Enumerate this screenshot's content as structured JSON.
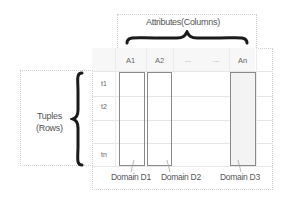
{
  "attributes": {
    "label": "Attributes(Columns)"
  },
  "tuples": {
    "label_line1": "Tuples",
    "label_line2": "(Rows)"
  },
  "table": {
    "headers": [
      "A1",
      "A2",
      "...",
      "...",
      "An"
    ],
    "rows": [
      "t1",
      "t2",
      "",
      "tn"
    ]
  },
  "domains": [
    "Domain D1",
    "Domain D2",
    "Domain D3"
  ],
  "colors": {
    "box_border": "#8a8a8a",
    "grid": "#e6e6e6",
    "dotted": "#cfcfcf",
    "brace": "#1a1a1a"
  }
}
